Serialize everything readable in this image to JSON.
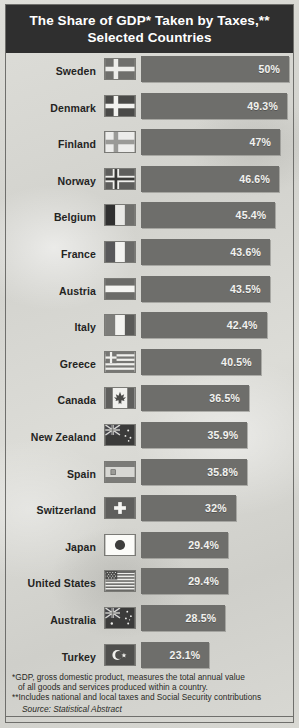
{
  "title": "The Share of GDP* Taken by Taxes,** Selected Countries",
  "colors": {
    "header_bg": "#2f2f2f",
    "bar": "#6e6e6b",
    "paper": "#d8d8d3",
    "label_text": "#24241f",
    "value_text": "#f2f2ef"
  },
  "notes": {
    "note1": "*GDP, gross domestic product, measures the total annual value",
    "note1_cont": "of all goods and services produced within a country.",
    "note2": "**Includes national and local taxes and Social Security contributions",
    "source": "Source: Statistical Abstract"
  },
  "chart_data": {
    "type": "bar",
    "orientation": "horizontal",
    "title": "The Share of GDP* Taken by Taxes,** Selected Countries",
    "xlabel": "",
    "ylabel": "",
    "xlim": [
      0,
      50
    ],
    "grid": false,
    "legend": false,
    "value_unit": "%",
    "categories": [
      "Sweden",
      "Denmark",
      "Finland",
      "Norway",
      "Belgium",
      "France",
      "Austria",
      "Italy",
      "Greece",
      "Canada",
      "New Zealand",
      "Spain",
      "Switzerland",
      "Japan",
      "United States",
      "Australia",
      "Turkey"
    ],
    "values": [
      50,
      49.3,
      47,
      46.6,
      45.4,
      43.6,
      43.5,
      42.4,
      40.5,
      36.5,
      35.9,
      35.8,
      32,
      29.4,
      29.4,
      28.5,
      23.1
    ],
    "labels": [
      "50%",
      "49.3%",
      "47%",
      "46.6%",
      "45.4%",
      "43.6%",
      "43.5%",
      "42.4%",
      "40.5%",
      "36.5%",
      "35.9%",
      "35.8%",
      "32%",
      "29.4%",
      "29.4%",
      "28.5%",
      "23.1%"
    ],
    "rows": [
      {
        "country": "Sweden",
        "value": 50,
        "label": "50%",
        "flag": "flag-sweden"
      },
      {
        "country": "Denmark",
        "value": 49.3,
        "label": "49.3%",
        "flag": "flag-denmark"
      },
      {
        "country": "Finland",
        "value": 47,
        "label": "47%",
        "flag": "flag-finland"
      },
      {
        "country": "Norway",
        "value": 46.6,
        "label": "46.6%",
        "flag": "flag-norway"
      },
      {
        "country": "Belgium",
        "value": 45.4,
        "label": "45.4%",
        "flag": "flag-belgium"
      },
      {
        "country": "France",
        "value": 43.6,
        "label": "43.6%",
        "flag": "flag-france"
      },
      {
        "country": "Austria",
        "value": 43.5,
        "label": "43.5%",
        "flag": "flag-austria"
      },
      {
        "country": "Italy",
        "value": 42.4,
        "label": "42.4%",
        "flag": "flag-italy"
      },
      {
        "country": "Greece",
        "value": 40.5,
        "label": "40.5%",
        "flag": "flag-greece"
      },
      {
        "country": "Canada",
        "value": 36.5,
        "label": "36.5%",
        "flag": "flag-canada"
      },
      {
        "country": "New Zealand",
        "value": 35.9,
        "label": "35.9%",
        "flag": "flag-new-zealand"
      },
      {
        "country": "Spain",
        "value": 35.8,
        "label": "35.8%",
        "flag": "flag-spain"
      },
      {
        "country": "Switzerland",
        "value": 32,
        "label": "32%",
        "flag": "flag-switzerland"
      },
      {
        "country": "Japan",
        "value": 29.4,
        "label": "29.4%",
        "flag": "flag-japan"
      },
      {
        "country": "United States",
        "value": 29.4,
        "label": "29.4%",
        "flag": "flag-united-states"
      },
      {
        "country": "Australia",
        "value": 28.5,
        "label": "28.5%",
        "flag": "flag-australia"
      },
      {
        "country": "Turkey",
        "value": 23.1,
        "label": "23.1%",
        "flag": "flag-turkey"
      }
    ]
  }
}
